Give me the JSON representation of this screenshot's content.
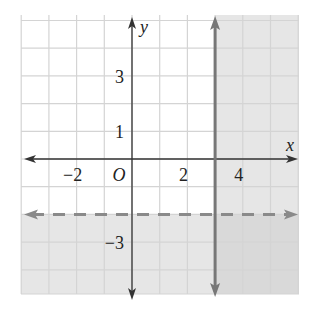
{
  "chart_data": {
    "type": "inequality-graph",
    "title": "",
    "xlabel": "x",
    "ylabel": "y",
    "origin_label": "O",
    "xlim": [
      -4,
      6
    ],
    "ylim": [
      -5,
      5.2
    ],
    "grid": true,
    "grid_step": 1,
    "x_tick_labels": [
      {
        "value": -2,
        "label": "−2"
      },
      {
        "value": 2,
        "label": "2"
      },
      {
        "value": 4,
        "label": "4"
      }
    ],
    "y_tick_labels": [
      {
        "value": 3,
        "label": "3"
      },
      {
        "value": 1,
        "label": "1"
      },
      {
        "value": -3,
        "label": "−3"
      }
    ],
    "boundaries": [
      {
        "equation": "x = 3",
        "style": "solid",
        "color": "#777777"
      },
      {
        "equation": "y = -2",
        "style": "dashed",
        "color": "#888888"
      }
    ],
    "shaded_regions": [
      {
        "description": "x ≥ 3",
        "color": "#e3e3e3"
      },
      {
        "description": "y < -2",
        "color": "#e3e3e3"
      }
    ],
    "solution": "x ≥ 3 or y < -2"
  },
  "colors": {
    "grid": "#d4d4d4",
    "axis": "#333333",
    "shade": "#e6e6e6",
    "solid_line": "#777777",
    "dashed_line": "#8a8a8a"
  }
}
